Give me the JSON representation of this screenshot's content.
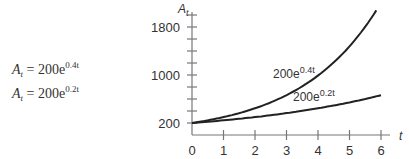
{
  "equations": [
    {
      "lhs": "A",
      "sub": "t",
      "eq": "=",
      "coef": "200e",
      "exp": "0.4t"
    },
    {
      "lhs": "A",
      "sub": "t",
      "eq": "=",
      "coef": "200e",
      "exp": "0.2t"
    }
  ],
  "chart_data": {
    "type": "line",
    "title": "",
    "xlabel": "t",
    "ylabel": "A_t",
    "x": [
      0,
      1,
      2,
      3,
      4,
      5,
      6
    ],
    "x_ticks": [
      "0",
      "1",
      "2",
      "3",
      "4",
      "5",
      "6"
    ],
    "y_ticks": [
      "200",
      "1000",
      "1800"
    ],
    "ylim": [
      0,
      2200
    ],
    "xlim": [
      0,
      6.3
    ],
    "grid": false,
    "series": [
      {
        "name": "200e^{0.4t}",
        "label_base": "200e",
        "label_exp": "0.4t",
        "values": [
          200,
          298,
          445,
          664,
          991,
          1478,
          2205
        ]
      },
      {
        "name": "200e^{0.2t}",
        "label_base": "200e",
        "label_exp": "0.2t",
        "values": [
          200,
          244,
          298,
          364,
          445,
          544,
          664
        ]
      }
    ]
  }
}
